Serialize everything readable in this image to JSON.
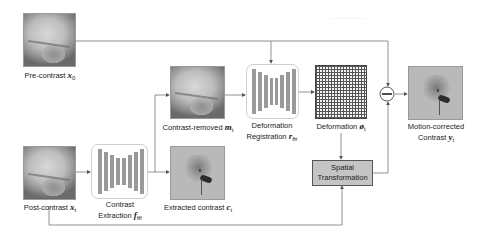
{
  "diagram": {
    "nodes": {
      "pre_contrast": {
        "label": "Pre-contrast",
        "symbol": "x",
        "subscript": "0"
      },
      "post_contrast": {
        "label": "Post-contrast",
        "symbol": "x",
        "subscript": "t"
      },
      "contrast_extraction": {
        "line1": "Contrast",
        "line2": "Extraction",
        "symbol": "f",
        "subscript": "θf"
      },
      "contrast_removed": {
        "label": "Contrast-removed",
        "symbol": "m",
        "subscript": "t"
      },
      "extracted_contrast": {
        "label": "Extracted contrast",
        "symbol": "c",
        "subscript": "t"
      },
      "deformation_registration": {
        "line1": "Deformation",
        "line2": "Registration",
        "symbol": "r",
        "subscript": "θr"
      },
      "deformation": {
        "label": "Deformation",
        "symbol": "ø",
        "subscript": "t"
      },
      "spatial_transformation": {
        "line1": "Spatial",
        "line2": "Transformation"
      },
      "subtract_operator": {
        "symbol": "−"
      },
      "motion_corrected": {
        "line1": "Motion-corrected",
        "line2": "Contrast",
        "symbol": "y",
        "subscript": "t"
      }
    },
    "colors": {
      "line": "#555555",
      "network_bar": "#9a9a9a",
      "spatial_box_fill": "#c4c4c4",
      "network_border": "#cfcfcf"
    }
  }
}
